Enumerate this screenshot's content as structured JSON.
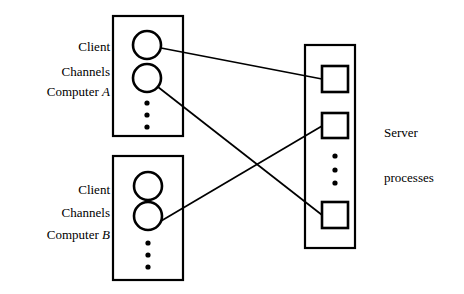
{
  "figure": {
    "type": "diagram",
    "title": "",
    "background_color": "#ffffff",
    "stroke_color": "#000000"
  },
  "labels": {
    "client_a_line1": "Client",
    "client_a_line2_prefix": "Computer ",
    "client_a_line2_var": "A",
    "channels_a": "Channels",
    "client_b_line1": "Client",
    "client_b_line2_prefix": "Computer ",
    "client_b_line2_var": "B",
    "channels_b": "Channels",
    "server_line1": "Server",
    "server_line2": "processes"
  },
  "nodes": {
    "client_a_box": {
      "x": 113,
      "y": 16,
      "width": 70,
      "height": 120
    },
    "client_b_box": {
      "x": 113,
      "y": 156,
      "width": 70,
      "height": 124
    },
    "server_box": {
      "x": 305,
      "y": 45,
      "width": 50,
      "height": 203
    },
    "client_a_channels": [
      {
        "cx": 147,
        "cy": 45,
        "r": 14
      },
      {
        "cx": 147,
        "cy": 78,
        "r": 14
      }
    ],
    "client_a_ellipsis": [
      {
        "cx": 147,
        "cy": 103,
        "r": 2.6
      },
      {
        "cx": 147,
        "cy": 115,
        "r": 2.6
      },
      {
        "cx": 147,
        "cy": 127,
        "r": 2.6
      }
    ],
    "client_b_channels": [
      {
        "cx": 148,
        "cy": 186,
        "r": 14
      },
      {
        "cx": 148,
        "cy": 216,
        "r": 14
      }
    ],
    "client_b_ellipsis": [
      {
        "cx": 148,
        "cy": 243,
        "r": 2.6
      },
      {
        "cx": 148,
        "cy": 255,
        "r": 2.6
      },
      {
        "cx": 148,
        "cy": 267,
        "r": 2.6
      }
    ],
    "server_processes": [
      {
        "x": 322,
        "y": 66,
        "width": 26,
        "height": 26
      },
      {
        "x": 322,
        "y": 113,
        "width": 26,
        "height": 25
      },
      {
        "x": 322,
        "y": 202,
        "width": 26,
        "height": 26
      }
    ],
    "server_ellipsis": [
      {
        "cx": 335,
        "cy": 156,
        "r": 2.6
      },
      {
        "cx": 335,
        "cy": 170,
        "r": 2.6
      },
      {
        "cx": 335,
        "cy": 183,
        "r": 2.6
      }
    ]
  },
  "connections": [
    {
      "from": "client-a-channel-1",
      "to": "server-process-1",
      "x1": 161,
      "y1": 48,
      "x2": 322,
      "y2": 79
    },
    {
      "from": "client-a-channel-2",
      "to": "server-process-3",
      "x1": 158,
      "y1": 87,
      "x2": 322,
      "y2": 215
    },
    {
      "from": "client-b-channel-2",
      "to": "server-process-2",
      "x1": 161,
      "y1": 221,
      "x2": 322,
      "y2": 126
    }
  ]
}
